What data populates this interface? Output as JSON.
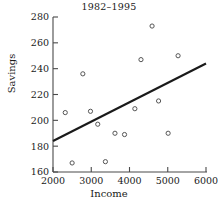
{
  "chart_data": {
    "type": "scatter",
    "title": "1982–1995",
    "xlabel": "Income",
    "ylabel": "Savings",
    "xlim": [
      2000,
      6000
    ],
    "ylim": [
      160,
      280
    ],
    "xticks": [
      2000,
      3000,
      4000,
      5000,
      6000
    ],
    "yticks": [
      160,
      180,
      200,
      220,
      240,
      260,
      280
    ],
    "xtick_labels": [
      "2000",
      "3000",
      "4000",
      "5000",
      "6000"
    ],
    "ytick_labels": [
      "160",
      "180",
      "200",
      "220",
      "240",
      "260",
      "280"
    ],
    "grid": false,
    "legend": null,
    "marker": "open-circle",
    "points": [
      {
        "x": 2320,
        "y": 206
      },
      {
        "x": 2500,
        "y": 167
      },
      {
        "x": 2780,
        "y": 236
      },
      {
        "x": 2980,
        "y": 207
      },
      {
        "x": 3170,
        "y": 197
      },
      {
        "x": 3370,
        "y": 168
      },
      {
        "x": 3620,
        "y": 190
      },
      {
        "x": 3870,
        "y": 189
      },
      {
        "x": 4140,
        "y": 209
      },
      {
        "x": 4300,
        "y": 247
      },
      {
        "x": 4590,
        "y": 273
      },
      {
        "x": 4760,
        "y": 215
      },
      {
        "x": 5010,
        "y": 190
      },
      {
        "x": 5270,
        "y": 250
      }
    ],
    "trend_line": {
      "type": "linear-fit",
      "x_start": 2000,
      "y_start": 184,
      "x_end": 6000,
      "y_end": 244
    }
  }
}
